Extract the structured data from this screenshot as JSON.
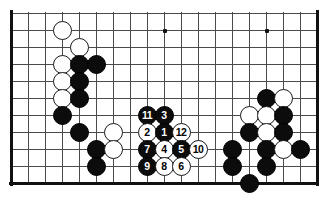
{
  "diagram": {
    "board_size": 19,
    "colors": {
      "black_stone": "#0c0c0c",
      "white_stone": "#ffffff",
      "grid_line": "#4a4a4a",
      "edge_line": "#111111",
      "background": "#ffffff",
      "black_label_text": "#ffffff",
      "white_label_text": "#000000"
    },
    "geometry": {
      "origin_x": 11,
      "origin_y": 13,
      "cell": 17,
      "cols_visible": 19,
      "rows_visible": 11,
      "stone_diameter": 19
    },
    "edges": {
      "left_border": true,
      "right_border": true,
      "bottom_border": true,
      "top_border": false
    },
    "star_points": [
      {
        "col": 3,
        "row": 1
      },
      {
        "col": 9,
        "row": 1
      },
      {
        "col": 15,
        "row": 1
      }
    ],
    "stones": [
      {
        "col": 3,
        "row": 1,
        "color": "white",
        "label": ""
      },
      {
        "col": 4,
        "row": 2,
        "color": "white",
        "label": ""
      },
      {
        "col": 3,
        "row": 3,
        "color": "white",
        "label": ""
      },
      {
        "col": 4,
        "row": 3,
        "color": "black",
        "label": ""
      },
      {
        "col": 5,
        "row": 3,
        "color": "black",
        "label": ""
      },
      {
        "col": 3,
        "row": 4,
        "color": "white",
        "label": ""
      },
      {
        "col": 4,
        "row": 4,
        "color": "black",
        "label": ""
      },
      {
        "col": 3,
        "row": 5,
        "color": "white",
        "label": ""
      },
      {
        "col": 4,
        "row": 5,
        "color": "black",
        "label": ""
      },
      {
        "col": 3,
        "row": 6,
        "color": "black",
        "label": ""
      },
      {
        "col": 4,
        "row": 7,
        "color": "black",
        "label": ""
      },
      {
        "col": 5,
        "row": 8,
        "color": "black",
        "label": ""
      },
      {
        "col": 6,
        "row": 7,
        "color": "white",
        "label": ""
      },
      {
        "col": 6,
        "row": 8,
        "color": "white",
        "label": ""
      },
      {
        "col": 5,
        "row": 9,
        "color": "black",
        "label": ""
      },
      {
        "col": 8,
        "row": 6,
        "color": "black",
        "label": "11"
      },
      {
        "col": 9,
        "row": 6,
        "color": "black",
        "label": "3"
      },
      {
        "col": 8,
        "row": 7,
        "color": "white",
        "label": "2"
      },
      {
        "col": 9,
        "row": 7,
        "color": "black",
        "label": "1"
      },
      {
        "col": 10,
        "row": 7,
        "color": "white",
        "label": "12"
      },
      {
        "col": 8,
        "row": 8,
        "color": "black",
        "label": "7"
      },
      {
        "col": 9,
        "row": 8,
        "color": "white",
        "label": "4"
      },
      {
        "col": 10,
        "row": 8,
        "color": "black",
        "label": "5"
      },
      {
        "col": 11,
        "row": 8,
        "color": "white",
        "label": "10"
      },
      {
        "col": 8,
        "row": 9,
        "color": "black",
        "label": "9"
      },
      {
        "col": 9,
        "row": 9,
        "color": "white",
        "label": "8"
      },
      {
        "col": 10,
        "row": 9,
        "color": "white",
        "label": "6"
      },
      {
        "col": 15,
        "row": 5,
        "color": "black",
        "label": ""
      },
      {
        "col": 16,
        "row": 5,
        "color": "white",
        "label": ""
      },
      {
        "col": 14,
        "row": 6,
        "color": "white",
        "label": ""
      },
      {
        "col": 15,
        "row": 6,
        "color": "white",
        "label": ""
      },
      {
        "col": 16,
        "row": 6,
        "color": "black",
        "label": ""
      },
      {
        "col": 14,
        "row": 7,
        "color": "black",
        "label": ""
      },
      {
        "col": 15,
        "row": 7,
        "color": "white",
        "label": ""
      },
      {
        "col": 16,
        "row": 7,
        "color": "black",
        "label": ""
      },
      {
        "col": 13,
        "row": 8,
        "color": "black",
        "label": ""
      },
      {
        "col": 15,
        "row": 8,
        "color": "black",
        "label": ""
      },
      {
        "col": 16,
        "row": 8,
        "color": "white",
        "label": ""
      },
      {
        "col": 17,
        "row": 8,
        "color": "black",
        "label": ""
      },
      {
        "col": 13,
        "row": 9,
        "color": "black",
        "label": ""
      },
      {
        "col": 15,
        "row": 9,
        "color": "black",
        "label": ""
      },
      {
        "col": 14,
        "row": 10,
        "color": "black",
        "label": ""
      }
    ]
  }
}
